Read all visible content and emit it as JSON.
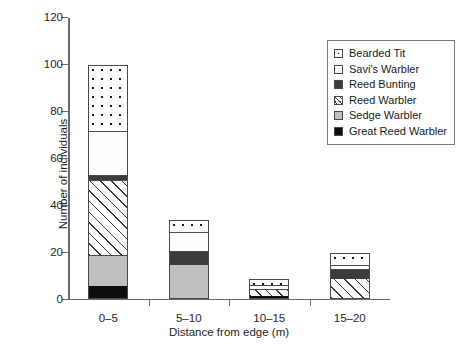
{
  "chart_data": {
    "type": "bar",
    "stacked": true,
    "title": "",
    "xlabel": "Distance from edge (m)",
    "ylabel": "Number of individuals",
    "categories": [
      "0–5",
      "5–10",
      "10–15",
      "15–20"
    ],
    "ylim": [
      0,
      120
    ],
    "yticks": [
      0,
      20,
      40,
      60,
      80,
      100,
      120
    ],
    "ytick_labels": [
      "0",
      "20",
      "40",
      "60",
      "80",
      "100",
      "120"
    ],
    "grid": false,
    "legend_position": "top-right",
    "series": [
      {
        "name": "Great Reed Warbler",
        "pattern": "solid-black",
        "color": "#0d0d0d",
        "values": [
          5,
          0,
          0.5,
          0
        ]
      },
      {
        "name": "Sedge Warbler",
        "pattern": "solid-lgray",
        "color": "#bfbfbf",
        "values": [
          13,
          14,
          0,
          0
        ]
      },
      {
        "name": "Reed Warbler",
        "pattern": "diagonal-hatch",
        "color": "#fcfcfc",
        "values": [
          32,
          0,
          3,
          8
        ]
      },
      {
        "name": "Reed Bunting",
        "pattern": "solid-dgray",
        "color": "#3c3c3c",
        "values": [
          2,
          6,
          0,
          4
        ]
      },
      {
        "name": "Savi's Warbler",
        "pattern": "solid-white",
        "color": "#fdfdfd",
        "values": [
          19,
          8,
          2,
          2
        ]
      },
      {
        "name": "Bearded Tit",
        "pattern": "dotted",
        "color": "#ffffff",
        "values": [
          28,
          5,
          2.5,
          5
        ]
      }
    ],
    "totals": [
      99,
      33,
      8,
      19
    ],
    "stack_order_bottom_to_top": [
      "Great Reed Warbler",
      "Sedge Warbler",
      "Reed Warbler",
      "Reed Bunting",
      "Savi's Warbler",
      "Bearded Tit"
    ]
  },
  "legend": {
    "entries": [
      {
        "label": "Bearded Tit",
        "pattern": "dotted"
      },
      {
        "label": "Savi's Warbler",
        "pattern": "solid-white"
      },
      {
        "label": "Reed Bunting",
        "pattern": "solid-dgray"
      },
      {
        "label": "Reed Warbler",
        "pattern": "diagonal-hatch"
      },
      {
        "label": "Sedge Warbler",
        "pattern": "solid-lgray"
      },
      {
        "label": "Great Reed Warbler",
        "pattern": "solid-black"
      }
    ]
  }
}
